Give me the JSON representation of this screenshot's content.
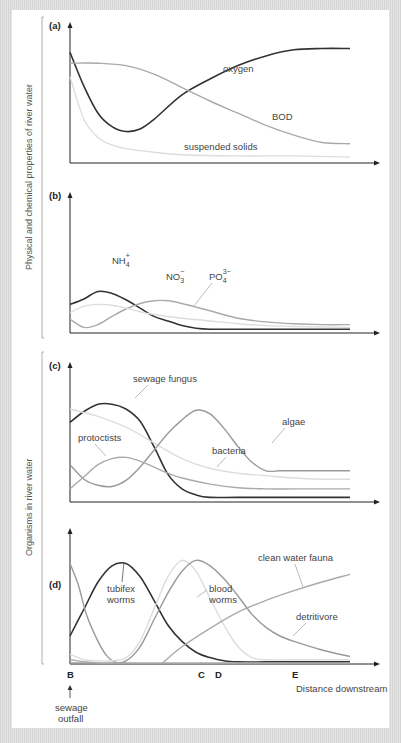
{
  "y_groups": [
    {
      "label": "Physical and chemical properties of river water"
    },
    {
      "label": "Organisms in river water"
    }
  ],
  "x_markers": {
    "labels": [
      "B",
      "C",
      "D",
      "E"
    ],
    "positions": [
      0,
      70.6,
      77,
      96.6
    ],
    "axis_label": "Distance downstream",
    "outfall_label_line1": "sewage",
    "outfall_label_line2": "outfall"
  },
  "chart_data": [
    {
      "type": "line",
      "panel": "(a)",
      "xlim": [
        0,
        100
      ],
      "ylim": [
        0,
        100
      ],
      "series": [
        {
          "name": "oxygen",
          "color": "#333333",
          "x": [
            0,
            5,
            10,
            15,
            20,
            25,
            30,
            40,
            50,
            60,
            70,
            80,
            90,
            100
          ],
          "y": [
            90,
            62,
            40,
            29,
            25,
            27,
            35,
            55,
            68,
            79,
            87,
            92,
            93,
            93
          ]
        },
        {
          "name": "BOD",
          "color": "#aaaaaa",
          "x": [
            0,
            10,
            20,
            30,
            40,
            50,
            60,
            70,
            80,
            90,
            100
          ],
          "y": [
            81,
            81,
            79,
            72,
            61,
            50,
            40,
            30,
            22,
            16,
            15
          ]
        },
        {
          "name": "suspended solids",
          "color": "#dddddd",
          "x": [
            0,
            5,
            10,
            15,
            20,
            30,
            40,
            60,
            80,
            100
          ],
          "y": [
            70,
            35,
            20,
            14,
            11,
            8,
            6,
            5,
            5,
            4
          ]
        }
      ]
    },
    {
      "type": "line",
      "panel": "(b)",
      "xlim": [
        0,
        100
      ],
      "ylim": [
        0,
        100
      ],
      "series": [
        {
          "name": "NH4+",
          "label_main": "NH",
          "label_sub": "4",
          "label_sup": "+",
          "color": "#333333",
          "x": [
            0,
            5,
            10,
            15,
            20,
            25,
            30,
            35,
            40,
            45,
            50,
            60,
            80,
            100
          ],
          "y": [
            30,
            36,
            44,
            42,
            35,
            26,
            17,
            12,
            7,
            4,
            3,
            3,
            3,
            3
          ]
        },
        {
          "name": "NO3-",
          "label_main": "NO",
          "label_sub": "3",
          "label_sup": "−",
          "color": "#aaaaaa",
          "x": [
            0,
            5,
            10,
            15,
            20,
            25,
            30,
            35,
            40,
            50,
            60,
            70,
            80,
            90,
            100
          ],
          "y": [
            14,
            5,
            8,
            17,
            25,
            31,
            34,
            34,
            31,
            23,
            15,
            11,
            9,
            8,
            8
          ]
        },
        {
          "name": "PO4 3-",
          "label_main": "PO",
          "label_sub": "4",
          "label_sup": "3−",
          "color": "#dddddd",
          "x": [
            0,
            5,
            10,
            15,
            20,
            25,
            30,
            40,
            50,
            60,
            70,
            80,
            100
          ],
          "y": [
            21,
            28,
            30,
            29,
            26,
            22,
            19,
            15,
            12,
            9,
            7,
            6,
            5
          ]
        }
      ]
    },
    {
      "type": "line",
      "panel": "(c)",
      "xlim": [
        0,
        100
      ],
      "ylim": [
        0,
        100
      ],
      "series": [
        {
          "name": "sewage fungus",
          "color": "#333333",
          "x": [
            0,
            5,
            10,
            15,
            20,
            25,
            30,
            35,
            40,
            45,
            50,
            60,
            80,
            100
          ],
          "y": [
            65,
            74,
            80,
            80,
            76,
            66,
            45,
            22,
            10,
            5,
            3,
            3,
            3,
            3
          ]
        },
        {
          "name": "bacteria",
          "color": "#dddddd",
          "x": [
            0,
            10,
            20,
            30,
            40,
            50,
            60,
            70,
            80,
            90,
            100
          ],
          "y": [
            76,
            70,
            61,
            48,
            35,
            27,
            23,
            21,
            19,
            18,
            18
          ]
        },
        {
          "name": "algae",
          "color": "#999999",
          "x": [
            0,
            5,
            10,
            15,
            20,
            25,
            30,
            35,
            40,
            45,
            50,
            55,
            60,
            65,
            70,
            75,
            80,
            90,
            100
          ],
          "y": [
            30,
            18,
            13,
            12,
            17,
            28,
            42,
            56,
            67,
            75,
            72,
            60,
            45,
            32,
            25,
            25,
            25,
            25,
            25
          ]
        },
        {
          "name": "protoctists",
          "color": "#aaaaaa",
          "x": [
            0,
            5,
            10,
            15,
            20,
            25,
            30,
            35,
            40,
            50,
            60,
            70,
            80,
            100
          ],
          "y": [
            10,
            20,
            30,
            35,
            36,
            33,
            28,
            23,
            19,
            14,
            11,
            10,
            10,
            10
          ]
        }
      ]
    },
    {
      "type": "line",
      "panel": "(d)",
      "xlim": [
        0,
        100
      ],
      "ylim": [
        0,
        100
      ],
      "series": [
        {
          "name": "tubifex worms",
          "color": "#333333",
          "x": [
            0,
            5,
            10,
            15,
            20,
            25,
            30,
            35,
            40,
            45,
            50,
            55,
            60,
            70,
            80,
            100
          ],
          "y": [
            25,
            50,
            75,
            90,
            92,
            80,
            58,
            35,
            20,
            10,
            5,
            2,
            1,
            1,
            1,
            1
          ]
        },
        {
          "name": "sewage fungus decline",
          "color": "#999999",
          "x": [
            0,
            3,
            6,
            10,
            13,
            16,
            20
          ],
          "y": [
            92,
            72,
            44,
            20,
            7,
            1,
            0
          ]
        },
        {
          "name": "blood worms (light)",
          "color": "#dddddd",
          "x": [
            0,
            5,
            10,
            15,
            20,
            25,
            30,
            35,
            40,
            45,
            50,
            55,
            60,
            65,
            70,
            80,
            100
          ],
          "y": [
            8,
            3,
            2,
            2,
            5,
            20,
            50,
            80,
            95,
            85,
            60,
            35,
            15,
            5,
            3,
            3,
            3
          ]
        },
        {
          "name": "blood worms",
          "color": "#999999",
          "x": [
            0,
            15,
            20,
            25,
            30,
            35,
            40,
            45,
            50,
            55,
            60,
            65,
            70,
            75,
            80,
            90,
            100
          ],
          "y": [
            0,
            0,
            2,
            15,
            40,
            65,
            85,
            95,
            90,
            78,
            62,
            45,
            33,
            25,
            20,
            12,
            6
          ]
        },
        {
          "name": "clean water fauna",
          "color": "#aaaaaa",
          "x": [
            33,
            40,
            50,
            60,
            70,
            80,
            90,
            100
          ],
          "y": [
            0,
            15,
            32,
            47,
            58,
            67,
            75,
            82
          ]
        },
        {
          "name": "detritivore",
          "color": "#aaaaaa",
          "x": [
            0,
            10,
            20,
            30,
            40,
            50,
            60,
            70,
            80,
            90,
            100
          ],
          "y": [
            3,
            0,
            0,
            0,
            0,
            0,
            0,
            0,
            0,
            0,
            0
          ]
        }
      ]
    }
  ],
  "labels": {
    "a": {
      "panel": "(a)",
      "oxygen": "oxygen",
      "bod": "BOD",
      "solids": "suspended solids"
    },
    "b": {
      "panel": "(b)"
    },
    "c": {
      "panel": "(c)",
      "fungus": "sewage fungus",
      "algae": "algae",
      "protoctists": "protoctists",
      "bacteria": "bacteria"
    },
    "d": {
      "panel": "(d)",
      "tubifex1": "tubifex",
      "tubifex2": "worms",
      "blood1": "blood",
      "blood2": "worms",
      "fauna": "clean water fauna",
      "detritivore": "detritivore"
    }
  }
}
